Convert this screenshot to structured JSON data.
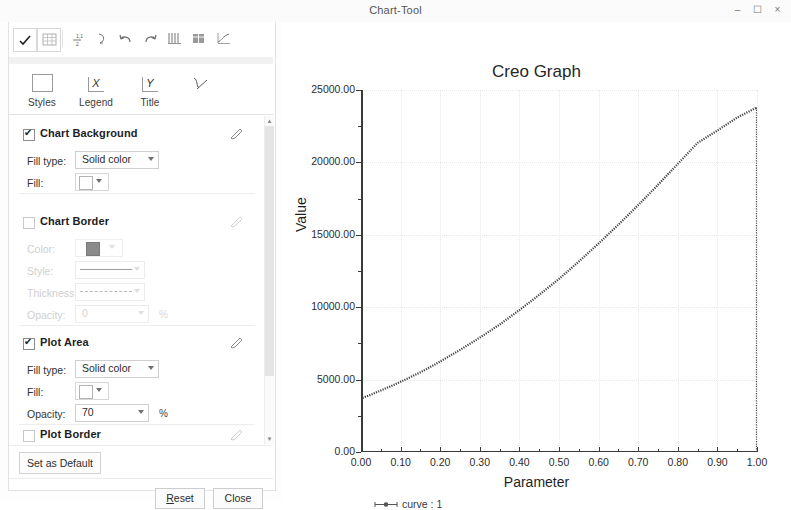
{
  "window": {
    "title": "Chart-Tool",
    "controls": {
      "minimize": "–",
      "maximize": "☐",
      "close": "×"
    }
  },
  "toolbar": {
    "buttons": [
      {
        "name": "apply-check-icon",
        "glyph": "✔"
      },
      {
        "name": "grid-table-icon",
        "glyph": "▦"
      },
      {
        "name": "sort-ascending-icon",
        "glyph": "↕"
      },
      {
        "name": "curve-edit-icon",
        "glyph": "⤵"
      },
      {
        "name": "undo-icon",
        "glyph": "↶"
      },
      {
        "name": "redo-icon",
        "glyph": "↷"
      },
      {
        "name": "column-chart-icon",
        "glyph": "▒"
      },
      {
        "name": "data-table-icon",
        "glyph": "▤"
      },
      {
        "name": "chart-preview-icon",
        "glyph": "⌇"
      }
    ]
  },
  "tabs": [
    {
      "label": "Styles",
      "icon": "styles-box-icon",
      "glyph": ""
    },
    {
      "label": "Legend",
      "icon": "x-axis-icon",
      "glyph": "X"
    },
    {
      "label": "Title",
      "icon": "y-axis-icon",
      "glyph": "Y"
    },
    {
      "label": "",
      "icon": "curve-icon",
      "glyph": "✓"
    }
  ],
  "panel": {
    "sections": [
      {
        "name": "chart-background",
        "title": "Chart Background",
        "checked": true,
        "enabled": true,
        "rows": [
          {
            "type": "combo",
            "label": "Fill type:",
            "value": "Solid color"
          },
          {
            "type": "swatch",
            "label": "Fill:",
            "value": ""
          }
        ]
      },
      {
        "name": "chart-border",
        "title": "Chart Border",
        "checked": false,
        "enabled": false,
        "rows": [
          {
            "type": "swatch",
            "label": "Color:",
            "value": "",
            "color": "#8b8b8b"
          },
          {
            "type": "line",
            "label": "Style:",
            "value": ""
          },
          {
            "type": "line-dashed",
            "label": "Thickness:",
            "value": ""
          },
          {
            "type": "combo",
            "label": "Opacity:",
            "value": "0",
            "suffix": "%"
          }
        ]
      },
      {
        "name": "plot-area",
        "title": "Plot Area",
        "checked": true,
        "enabled": true,
        "rows": [
          {
            "type": "combo",
            "label": "Fill type:",
            "value": "Solid color"
          },
          {
            "type": "swatch",
            "label": "Fill:",
            "value": ""
          },
          {
            "type": "combo",
            "label": "Opacity:",
            "value": "70",
            "suffix": "%"
          }
        ]
      },
      {
        "name": "plot-border",
        "title": "Plot Border",
        "checked": false,
        "enabled": false,
        "rows": []
      }
    ],
    "set_as_default": "Set as Default",
    "reset": "Reset",
    "reset_mnemonic": "R",
    "close": "Close"
  },
  "chart_data": {
    "type": "line",
    "title": "Creo Graph",
    "xlabel": "Parameter",
    "ylabel": "Value",
    "xlim": [
      0.0,
      1.0
    ],
    "ylim": [
      0.0,
      25000.0
    ],
    "xticks": [
      "0.00",
      "0.10",
      "0.20",
      "0.30",
      "0.40",
      "0.50",
      "0.60",
      "0.70",
      "0.80",
      "0.90",
      "1.00"
    ],
    "xtick_values": [
      0.0,
      0.1,
      0.2,
      0.3,
      0.4,
      0.5,
      0.6,
      0.7,
      0.8,
      0.9,
      1.0
    ],
    "yticks": [
      "0.00",
      "5000.00",
      "10000.00",
      "15000.00",
      "20000.00",
      "25000.00"
    ],
    "ytick_values": [
      0,
      5000,
      10000,
      15000,
      20000,
      25000
    ],
    "grid": true,
    "legend": [
      {
        "name": "curve : 1",
        "marker": "line-marker"
      }
    ],
    "legend_position": "bottom-left",
    "series": [
      {
        "name": "curve : 1",
        "style": "dotted-dense",
        "color": "#444444",
        "x": [
          0.0,
          0.0,
          0.02,
          0.05,
          0.08,
          0.1,
          0.15,
          0.2,
          0.25,
          0.3,
          0.35,
          0.4,
          0.45,
          0.5,
          0.55,
          0.6,
          0.65,
          0.7,
          0.75,
          0.8,
          0.85,
          0.9,
          0.95,
          1.0,
          1.0
        ],
        "y": [
          0,
          3700,
          3900,
          4250,
          4600,
          4850,
          5500,
          6250,
          7050,
          7900,
          8800,
          9800,
          10850,
          11950,
          13150,
          14400,
          15700,
          17050,
          18450,
          19900,
          21350,
          22200,
          23100,
          23800,
          0
        ]
      }
    ]
  }
}
